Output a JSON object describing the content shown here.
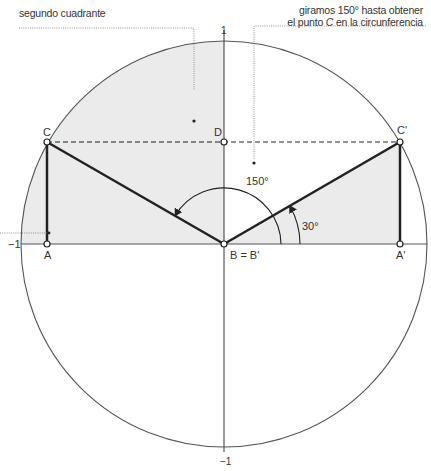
{
  "annotations": {
    "second_quadrant": "segundo cuadrante",
    "rotation_line1": "giramos 150° hasta obtener",
    "rotation_line2_pre": "el punto ",
    "rotation_line2_point": "C",
    "rotation_line2_post": " en la circunferencia"
  },
  "axis_labels": {
    "top": "1",
    "left": "−1",
    "bottom": "−1"
  },
  "points": {
    "C": "C",
    "D": "D",
    "C_prime": "C'",
    "A": "A",
    "B": "B = B'",
    "A_prime": "A'"
  },
  "angles": {
    "large": "150°",
    "small": "30°"
  },
  "colors": {
    "shade": "#ebebeb",
    "stroke": "#222222",
    "circle": "#555555",
    "leader": "#777777"
  },
  "geometry": {
    "center": [
      224,
      244
    ],
    "radius": 203,
    "rotation_deg": 150,
    "reference_deg": 30
  }
}
